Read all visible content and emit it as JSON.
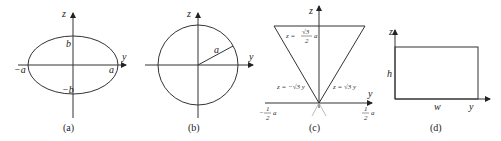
{
  "panels": [
    {
      "id": "a",
      "caption": "(a)",
      "shape": "ellipse",
      "axis_labels": {
        "vertical": "z",
        "horizontal": "y"
      },
      "labels": {
        "top": "b",
        "bottom": "−b",
        "left": "−a",
        "right": "a"
      }
    },
    {
      "id": "b",
      "caption": "(b)",
      "shape": "circle",
      "axis_labels": {
        "vertical": "z",
        "horizontal": "y"
      },
      "labels": {
        "radius": "a"
      }
    },
    {
      "id": "c",
      "caption": "(c)",
      "shape": "inverted-triangle",
      "axis_labels": {
        "vertical": "z",
        "horizontal": "y"
      },
      "labels": {
        "top_line_lhs": "z =",
        "top_line_num": "√3",
        "top_line_den": "2",
        "top_line_var": "a",
        "left_line": "z = −√3 y",
        "right_line": "z = √3 y",
        "left_tick_num": "1",
        "left_tick_den": "2",
        "left_tick_sign": "−",
        "left_tick_var": "a",
        "right_tick_num": "1",
        "right_tick_den": "2",
        "right_tick_var": "a"
      }
    },
    {
      "id": "d",
      "caption": "(d)",
      "shape": "rectangle",
      "axis_labels": {
        "vertical": "z",
        "horizontal": "y"
      },
      "labels": {
        "height": "h",
        "width": "w"
      }
    }
  ]
}
